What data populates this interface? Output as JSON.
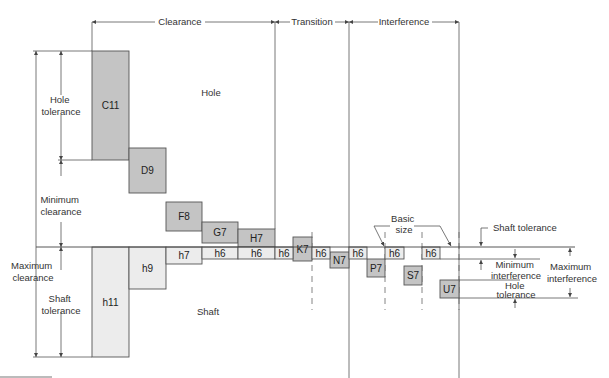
{
  "zones": {
    "clearance": "Clearance",
    "transition": "Transition",
    "interference": "Interference"
  },
  "region_labels": {
    "hole": "Hole",
    "shaft": "Shaft"
  },
  "left_dims": {
    "hole_tolerance": [
      "Hole",
      "tolerance"
    ],
    "minimum_clearance": [
      "Minimum",
      "clearance"
    ],
    "maximum_clearance": [
      "Maximum",
      "clearance"
    ],
    "shaft_tolerance": [
      "Shaft",
      "tolerance"
    ]
  },
  "right_dims": {
    "basic_size": [
      "Basic",
      "size"
    ],
    "shaft_tolerance": "Shaft tolerance",
    "minimum_interference": [
      "Minimum",
      "interference"
    ],
    "maximum_interference": [
      "Maximum",
      "interference"
    ],
    "hole_tolerance": [
      "Hole",
      "tolerance"
    ]
  },
  "hole_boxes": [
    {
      "label": "C11",
      "x": 92,
      "y": 51,
      "w": 37,
      "h": 109
    },
    {
      "label": "D9",
      "x": 129,
      "y": 148,
      "w": 37,
      "h": 45
    },
    {
      "label": "F8",
      "x": 166,
      "y": 202,
      "w": 36,
      "h": 29
    },
    {
      "label": "G7",
      "x": 202,
      "y": 222,
      "w": 36,
      "h": 21
    },
    {
      "label": "H7",
      "x": 238,
      "y": 229,
      "w": 37,
      "h": 18
    },
    {
      "label": "K7",
      "x": 293,
      "y": 237,
      "w": 19,
      "h": 24
    },
    {
      "label": "N7",
      "x": 330,
      "y": 252,
      "w": 19,
      "h": 16
    },
    {
      "label": "P7",
      "x": 367,
      "y": 259,
      "w": 18,
      "h": 18
    },
    {
      "label": "S7",
      "x": 404,
      "y": 266,
      "w": 18,
      "h": 19
    },
    {
      "label": "U7",
      "x": 440,
      "y": 280,
      "w": 19,
      "h": 18
    }
  ],
  "shaft_boxes": [
    {
      "label": "h11",
      "x": 92,
      "y": 247,
      "w": 37,
      "h": 110
    },
    {
      "label": "h9",
      "x": 129,
      "y": 247,
      "w": 37,
      "h": 42
    },
    {
      "label": "h7",
      "x": 166,
      "y": 247,
      "w": 36,
      "h": 17
    },
    {
      "label": "h6",
      "x": 202,
      "y": 247,
      "w": 36,
      "h": 12
    },
    {
      "label": "h6",
      "x": 238,
      "y": 247,
      "w": 37,
      "h": 12
    },
    {
      "label": "h6",
      "x": 275,
      "y": 247,
      "w": 18,
      "h": 12
    },
    {
      "label": "h6",
      "x": 312,
      "y": 247,
      "w": 18,
      "h": 12
    },
    {
      "label": "h6",
      "x": 349,
      "y": 247,
      "w": 18,
      "h": 12
    },
    {
      "label": "h6",
      "x": 385,
      "y": 247,
      "w": 19,
      "h": 12
    },
    {
      "label": "h6",
      "x": 422,
      "y": 247,
      "w": 18,
      "h": 12
    }
  ],
  "colors": {
    "hole_fill": "#c4c4c4",
    "shaft_fill": "#ececec",
    "stroke": "#555555",
    "text": "#333333"
  }
}
